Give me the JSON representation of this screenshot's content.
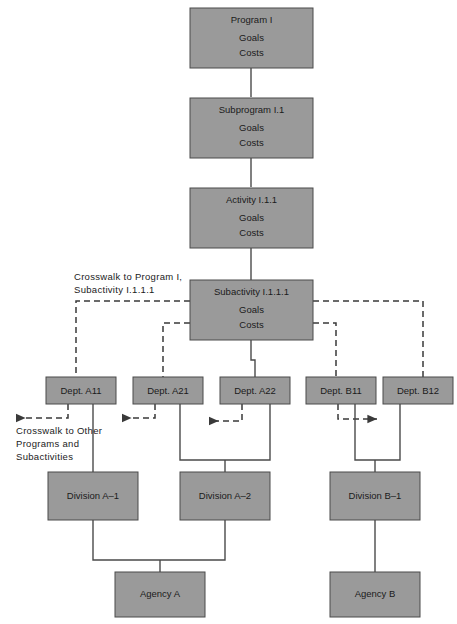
{
  "diagram": {
    "colors": {
      "box_fill": "#9a9a9a",
      "box_stroke": "#4a4a4a",
      "solid_line": "#4a4a4a",
      "dashed_line": "#3a3a3a",
      "text": "#1b1b1b",
      "background": "#ffffff"
    },
    "nodes": [
      {
        "id": "program",
        "title": "Program I",
        "line2": "Goals",
        "line3": "Costs"
      },
      {
        "id": "subprogram",
        "title": "Subprogram I.1",
        "line2": "Goals",
        "line3": "Costs"
      },
      {
        "id": "activity",
        "title": "Activity I.1.1",
        "line2": "Goals",
        "line3": "Costs"
      },
      {
        "id": "subactivity",
        "title": "Subactivity I.1.1.1",
        "line2": "Goals",
        "line3": "Costs"
      },
      {
        "id": "dept-a11",
        "title": "Dept. A11"
      },
      {
        "id": "dept-a21",
        "title": "Dept. A21"
      },
      {
        "id": "dept-a22",
        "title": "Dept. A22"
      },
      {
        "id": "dept-b11",
        "title": "Dept. B11"
      },
      {
        "id": "dept-b12",
        "title": "Dept. B12"
      },
      {
        "id": "division-a1",
        "title": "Division A–1"
      },
      {
        "id": "division-a2",
        "title": "Division A–2"
      },
      {
        "id": "division-b1",
        "title": "Division B–1"
      },
      {
        "id": "agency-a",
        "title": "Agency A"
      },
      {
        "id": "agency-b",
        "title": "Agency B"
      }
    ],
    "annotations": {
      "crosswalk_top": {
        "line1": "Crosswalk to Program I,",
        "line2": "Subactivity I.1.1.1"
      },
      "crosswalk_bottom": {
        "line1": "Crosswalk to Other",
        "line2": "Programs and",
        "line3": "Subactivities"
      }
    }
  }
}
